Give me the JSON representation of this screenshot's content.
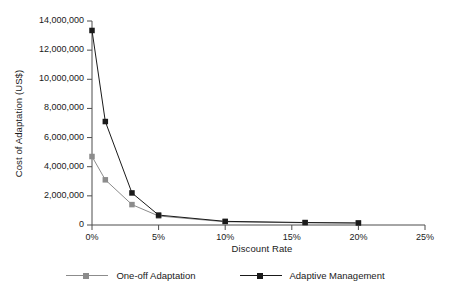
{
  "chart_data": {
    "type": "line",
    "title": "",
    "xlabel": "Discount Rate",
    "ylabel": "Cost of Adaptation (US$)",
    "x": [
      0,
      1,
      3,
      5,
      10,
      16,
      20
    ],
    "x_tick_labels": [
      "0%",
      "5%",
      "10%",
      "15%",
      "20%",
      "25%"
    ],
    "x_tick_values": [
      0,
      5,
      10,
      15,
      20,
      25
    ],
    "y_tick_labels": [
      "0",
      "2,000,000",
      "4,000,000",
      "6,000,000",
      "8,000,000",
      "10,000,000",
      "12,000,000",
      "14,000,000"
    ],
    "y_tick_values": [
      0,
      2000000,
      4000000,
      6000000,
      8000000,
      10000000,
      12000000,
      14000000
    ],
    "xlim": [
      0,
      25
    ],
    "ylim": [
      0,
      14000000
    ],
    "grid": false,
    "legend_position": "bottom",
    "series": [
      {
        "name": "One-off Adaptation",
        "color": "#8c8c8c",
        "marker": "square",
        "values": [
          4700000,
          3100000,
          1400000,
          620000,
          220000,
          150000,
          130000
        ]
      },
      {
        "name": "Adaptive Management",
        "color": "#1a1a1a",
        "marker": "square",
        "values": [
          13350000,
          7100000,
          2200000,
          680000,
          250000,
          170000,
          140000
        ]
      }
    ]
  },
  "axes": {
    "x_title": "Discount Rate",
    "y_title": "Cost of Adaptation (US$)"
  },
  "legend": {
    "entries": [
      {
        "label": "One-off Adaptation"
      },
      {
        "label": "Adaptive Management"
      }
    ]
  },
  "colors": {
    "series_one": "#8c8c8c",
    "series_two": "#1a1a1a",
    "axis": "#4d4d4d",
    "background": "#ffffff"
  }
}
